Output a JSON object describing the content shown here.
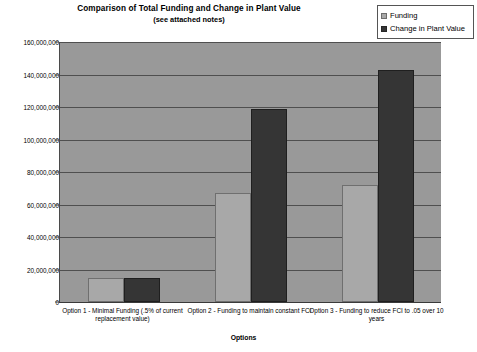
{
  "chart_data": {
    "type": "bar",
    "title": "Comparison of Total Funding and Change in Plant Value",
    "subtitle": "(see attached notes)",
    "xlabel": "Options",
    "ylabel": "Investment $",
    "ylim": [
      0,
      160000000
    ],
    "ytick_step": 20000000,
    "grid": true,
    "legend_position": "top-right",
    "categories": [
      "Option 1 - Minimal Funding (.5% of current replacement value)",
      "Option 2 - Funding to maintain constant FCI",
      "Option 3 - Funding to reduce FCI to .05 over 10 years"
    ],
    "ytick_labels": [
      "160,000,000",
      "140,000,000",
      "120,000,000",
      "100,000,000",
      "80,000,000",
      "60,000,000",
      "40,000,000",
      "20,000,000",
      "0"
    ],
    "series": [
      {
        "name": "Funding",
        "color": "#a8a8a8",
        "values": [
          15000000,
          67000000,
          72000000
        ]
      },
      {
        "name": "Change in Plant Value",
        "color": "#353535",
        "values": [
          15000000,
          119000000,
          143000000
        ]
      }
    ]
  },
  "colors": {
    "plot_background": "#999999",
    "gridline": "#4f4f4f",
    "axis": "#3a3a3a",
    "series_funding": "#a8a8a8",
    "series_change": "#353535",
    "page_background": "#ffffff"
  }
}
